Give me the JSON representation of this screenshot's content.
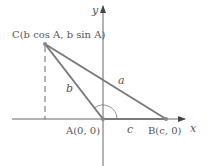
{
  "diagram": {
    "axes": {
      "x_label": "x",
      "y_label": "y"
    },
    "points": {
      "C": {
        "label": "C(b cos A, b sin A)"
      },
      "A": {
        "label": "A(0, 0)"
      },
      "B": {
        "label": "B(c, 0)"
      }
    },
    "sides": {
      "a": "a",
      "b": "b",
      "c": "c"
    },
    "colors": {
      "triangle": "#7a7a7a",
      "axis": "#555555",
      "point": "#8a8a8a"
    }
  }
}
